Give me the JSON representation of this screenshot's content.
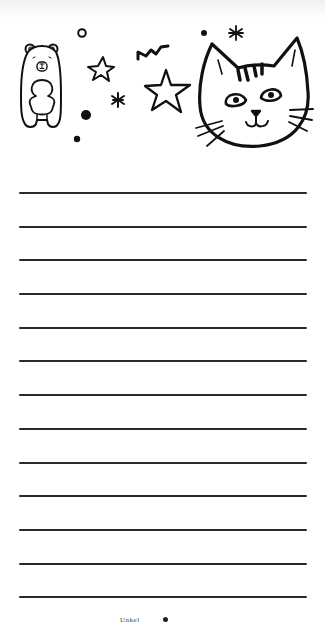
{
  "page": {
    "type": "lined-notepad-page",
    "background": "#ffffff",
    "line_color": "#2a2a2a",
    "ink_color": "#111111"
  },
  "illustrations": [
    {
      "name": "bear",
      "x": 18,
      "y": 44,
      "w": 44,
      "h": 86
    },
    {
      "name": "cat-head",
      "x": 195,
      "y": 35,
      "w": 120,
      "h": 115
    },
    {
      "name": "star-small",
      "cx": 101,
      "cy": 69
    },
    {
      "name": "star-large",
      "cx": 167,
      "cy": 92
    },
    {
      "name": "zigzag",
      "x": 137,
      "y": 45
    },
    {
      "name": "asterisk-1",
      "cx": 118,
      "cy": 100
    },
    {
      "name": "asterisk-2",
      "cx": 236,
      "cy": 33
    },
    {
      "name": "circle-outline",
      "cx": 82,
      "cy": 33
    },
    {
      "name": "dot-1",
      "cx": 86,
      "cy": 115
    },
    {
      "name": "dot-2",
      "cx": 77,
      "cy": 139
    },
    {
      "name": "dot-3",
      "cx": 204,
      "cy": 33
    }
  ],
  "ruled_lines": {
    "count": 13,
    "x_start": 19,
    "x_end": 307,
    "y_positions": [
      193,
      227,
      260,
      294,
      328,
      361,
      395,
      429,
      463,
      496,
      530,
      564,
      597
    ]
  },
  "footer": {
    "text": "Unkel"
  }
}
